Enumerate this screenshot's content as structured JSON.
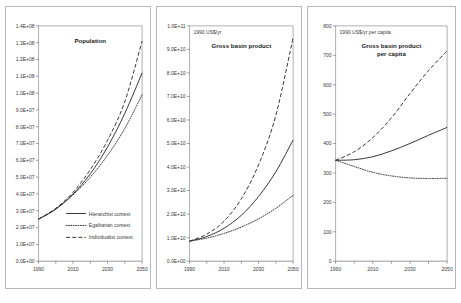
{
  "figure": {
    "name": "three-panel-scenario-projection-figure"
  },
  "series_styles": {
    "hierarchist": "solid",
    "egalitarian": "dotted",
    "individualist": "dashed"
  },
  "legend": {
    "items": [
      {
        "label": "Hierarchist context",
        "style": "solid"
      },
      {
        "label": "Egalitarian context",
        "style": "dotted"
      },
      {
        "label": "Individualist context",
        "style": "dashed"
      }
    ]
  },
  "chart_data": [
    {
      "type": "line",
      "panel": 1,
      "title": "Population",
      "unit_label": "",
      "xlabel": "",
      "ylabel": "",
      "xlim": [
        1990,
        2050
      ],
      "ylim": [
        0,
        140000000
      ],
      "grid": false,
      "legend_position": "inside-bottom-left",
      "x": [
        1990,
        2000,
        2010,
        2020,
        2030,
        2040,
        2050
      ],
      "xticks": [
        1990,
        2000,
        2010,
        2020,
        2030,
        2040,
        2050
      ],
      "xtick_labels": [
        "1990",
        "",
        "2010",
        "",
        "2030",
        "",
        "2050"
      ],
      "yticks": [
        0,
        10000000,
        20000000,
        30000000,
        40000000,
        50000000,
        60000000,
        70000000,
        80000000,
        90000000,
        100000000,
        110000000,
        120000000,
        130000000,
        140000000
      ],
      "ytick_labels": [
        "0.0E+00",
        "1.0E+07",
        "2.0E+07",
        "3.0E+07",
        "4.0E+07",
        "5.0E+07",
        "6.0E+07",
        "7.0E+07",
        "8.0E+07",
        "9.0E+07",
        "1.0E+08",
        "1.1E+08",
        "1.2E+08",
        "1.3E+08",
        "1.4E+08"
      ],
      "series": [
        {
          "name": "Hierarchist context",
          "style": "solid",
          "values": [
            25000000,
            31000000,
            40000000,
            52000000,
            68000000,
            88000000,
            112000000
          ]
        },
        {
          "name": "Egalitarian context",
          "style": "dotted",
          "values": [
            25000000,
            31000000,
            39500000,
            50000000,
            63000000,
            79000000,
            99000000
          ]
        },
        {
          "name": "Individualist context",
          "style": "dashed",
          "values": [
            25000000,
            31500000,
            41000000,
            54500000,
            72000000,
            95000000,
            131000000
          ]
        }
      ]
    },
    {
      "type": "line",
      "panel": 2,
      "title": "Gross basin product",
      "unit_label": "1990 US$/yr",
      "xlabel": "",
      "ylabel": "",
      "xlim": [
        1990,
        2050
      ],
      "ylim": [
        0,
        100000000000
      ],
      "grid": false,
      "legend_position": "none",
      "x": [
        1990,
        2000,
        2010,
        2020,
        2030,
        2040,
        2050
      ],
      "xticks": [
        1990,
        2000,
        2010,
        2020,
        2030,
        2040,
        2050
      ],
      "xtick_labels": [
        "1990",
        "",
        "2010",
        "",
        "2030",
        "",
        "2050"
      ],
      "yticks": [
        0,
        10000000000,
        20000000000,
        30000000000,
        40000000000,
        50000000000,
        60000000000,
        70000000000,
        80000000000,
        90000000000,
        100000000000
      ],
      "ytick_labels": [
        "0.0E+00",
        "1.0E+10",
        "2.0E+10",
        "3.0E+10",
        "4.0E+10",
        "5.0E+10",
        "6.0E+10",
        "7.0E+10",
        "8.0E+10",
        "9.0E+10",
        "1.0E+11"
      ],
      "series": [
        {
          "name": "Hierarchist context",
          "style": "solid",
          "values": [
            8500000000,
            10500000000,
            14000000000,
            19500000000,
            27500000000,
            38000000000,
            51500000000
          ]
        },
        {
          "name": "Egalitarian context",
          "style": "dotted",
          "values": [
            8500000000,
            9800000000,
            11800000000,
            14500000000,
            18000000000,
            22500000000,
            28000000000
          ]
        },
        {
          "name": "Individualist context",
          "style": "dashed",
          "values": [
            8500000000,
            11500000000,
            17000000000,
            26500000000,
            41000000000,
            62000000000,
            95000000000
          ]
        }
      ]
    },
    {
      "type": "line",
      "panel": 3,
      "title": "Gross basin product per capita",
      "unit_label": "1990 US$/yr per capita",
      "xlabel": "",
      "ylabel": "",
      "xlim": [
        1990,
        2050
      ],
      "ylim": [
        0,
        800
      ],
      "grid": false,
      "legend_position": "none",
      "x": [
        1990,
        2000,
        2010,
        2020,
        2030,
        2040,
        2050
      ],
      "xticks": [
        1990,
        2000,
        2010,
        2020,
        2030,
        2040,
        2050
      ],
      "xtick_labels": [
        "1990",
        "",
        "2010",
        "",
        "2030",
        "",
        "2050"
      ],
      "yticks": [
        0,
        100,
        200,
        300,
        400,
        500,
        600,
        700,
        800
      ],
      "ytick_labels": [
        "0",
        "100",
        "200",
        "300",
        "400",
        "500",
        "600",
        "700",
        "800"
      ],
      "series": [
        {
          "name": "Hierarchist context",
          "style": "solid",
          "values": [
            343,
            345,
            355,
            375,
            400,
            428,
            455
          ]
        },
        {
          "name": "Egalitarian context",
          "style": "dotted",
          "values": [
            343,
            322,
            302,
            290,
            283,
            281,
            282
          ]
        },
        {
          "name": "Individualist context",
          "style": "dashed",
          "values": [
            343,
            372,
            420,
            487,
            570,
            648,
            715
          ]
        }
      ]
    }
  ]
}
